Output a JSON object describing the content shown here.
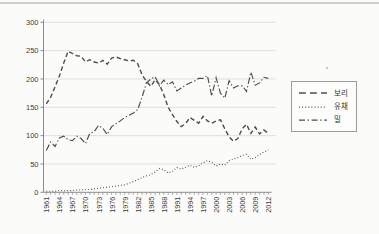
{
  "chart_data": {
    "type": "line",
    "title": "",
    "xlabel": "",
    "ylabel": "",
    "ylim": [
      0,
      300
    ],
    "y_ticks": [
      0,
      50,
      100,
      150,
      200,
      250,
      300
    ],
    "x": [
      1961,
      1962,
      1963,
      1964,
      1965,
      1966,
      1967,
      1968,
      1969,
      1970,
      1971,
      1972,
      1973,
      1974,
      1975,
      1976,
      1977,
      1978,
      1979,
      1980,
      1981,
      1982,
      1983,
      1984,
      1985,
      1986,
      1987,
      1988,
      1989,
      1990,
      1991,
      1992,
      1993,
      1994,
      1995,
      1996,
      1997,
      1998,
      1999,
      2000,
      2001,
      2002,
      2003,
      2004,
      2005,
      2006,
      2007,
      2008,
      2009,
      2010,
      2011,
      2012
    ],
    "x_tick_labels": [
      "1961",
      "1964",
      "1967",
      "1970",
      "1973",
      "1976",
      "1979",
      "1982",
      "1985",
      "1988",
      "1991",
      "1994",
      "1997",
      "2000",
      "2003",
      "2006",
      "2009",
      "2012"
    ],
    "x_label_every": 3,
    "grid": "horizontal",
    "legend_position": "right-outside",
    "line_color": "#4d4d4d",
    "grid_color": "#dddddb",
    "axis_color": "#8c8c8c",
    "tick_label_color": "#3c3c3c",
    "series": [
      {
        "name": "보리",
        "style": "dashed",
        "values": [
          156,
          168,
          186,
          205,
          228,
          249,
          245,
          241,
          240,
          230,
          234,
          230,
          228,
          233,
          226,
          237,
          239,
          236,
          234,
          232,
          233,
          227,
          207,
          196,
          187,
          198,
          190,
          172,
          150,
          137,
          125,
          116,
          121,
          132,
          127,
          122,
          134,
          126,
          122,
          126,
          128,
          112,
          98,
          90,
          95,
          112,
          120,
          104,
          115,
          103,
          110,
          104
        ]
      },
      {
        "name": "유채",
        "style": "dotted",
        "values": [
          2,
          2,
          2,
          3,
          3,
          3,
          3,
          4,
          4,
          5,
          5,
          6,
          7,
          8,
          9,
          10,
          11,
          12,
          13,
          16,
          19,
          22,
          26,
          29,
          31,
          36,
          42,
          40,
          34,
          37,
          44,
          41,
          44,
          48,
          44,
          47,
          52,
          56,
          53,
          46,
          50,
          48,
          56,
          59,
          61,
          65,
          67,
          58,
          61,
          67,
          71,
          75
        ]
      },
      {
        "name": "밀",
        "style": "dashdot",
        "values": [
          74,
          89,
          81,
          96,
          99,
          93,
          91,
          99,
          95,
          86,
          104,
          107,
          118,
          113,
          102,
          116,
          121,
          126,
          132,
          136,
          140,
          146,
          168,
          193,
          200,
          204,
          188,
          198,
          190,
          195,
          179,
          184,
          189,
          193,
          196,
          201,
          201,
          206,
          170,
          202,
          175,
          166,
          197,
          184,
          188,
          188,
          178,
          212,
          189,
          193,
          203,
          201
        ]
      }
    ]
  }
}
